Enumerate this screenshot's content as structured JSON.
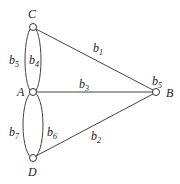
{
  "diagram": {
    "type": "graph",
    "nodes": [
      {
        "id": "C",
        "label": "C",
        "x": 33,
        "y": 27
      },
      {
        "id": "A",
        "label": "A",
        "x": 33,
        "y": 92
      },
      {
        "id": "D",
        "label": "D",
        "x": 33,
        "y": 158
      },
      {
        "id": "B",
        "label": "B",
        "x": 156,
        "y": 92
      }
    ],
    "edges": [
      {
        "id": "b1",
        "base": "b",
        "sub": "1",
        "from": "C",
        "to": "B"
      },
      {
        "id": "b2",
        "base": "b",
        "sub": "2",
        "from": "D",
        "to": "B"
      },
      {
        "id": "b3",
        "base": "b",
        "sub": "3",
        "from": "A",
        "to": "B"
      },
      {
        "id": "b4",
        "base": "b",
        "sub": "4",
        "from": "C",
        "to": "A"
      },
      {
        "id": "b5",
        "base": "b",
        "sub": "5",
        "from": "C",
        "to": "A"
      },
      {
        "id": "b6",
        "base": "b",
        "sub": "6",
        "from": "A",
        "to": "D"
      },
      {
        "id": "b7",
        "base": "b",
        "sub": "7",
        "from": "A",
        "to": "D"
      }
    ],
    "extra_labels": [
      {
        "id": "b5_at_B",
        "base": "b",
        "sub": "5"
      }
    ]
  }
}
